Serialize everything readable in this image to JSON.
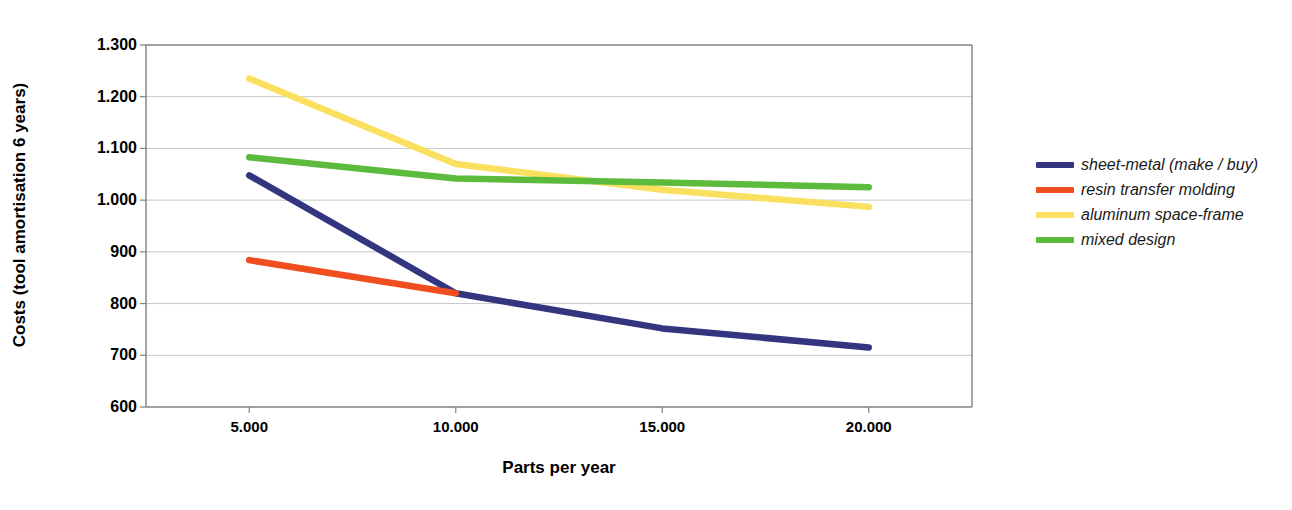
{
  "chart_data": {
    "type": "line",
    "title": "",
    "xlabel": "Parts per year",
    "ylabel": "Costs (tool amortisation 6 years)",
    "x": [
      5000,
      10000,
      15000,
      20000
    ],
    "xtick_labels": [
      "5.000",
      "10.000",
      "15.000",
      "20.000"
    ],
    "ytick_labels": [
      "1.300",
      "1.200",
      "1.100",
      "1.000",
      "900",
      "800",
      "700",
      "600"
    ],
    "ytick_values": [
      1300,
      1200,
      1100,
      1000,
      900,
      800,
      700,
      600
    ],
    "xlim": [
      2500,
      22500
    ],
    "ylim": [
      600,
      1300
    ],
    "grid": true,
    "legend_position": "right",
    "series": [
      {
        "name": "sheet-metal (make / buy)",
        "color": "#33357f",
        "x": [
          5000,
          10000,
          15000,
          20000
        ],
        "values": [
          1048,
          820,
          752,
          715
        ]
      },
      {
        "name": "resin transfer molding",
        "color": "#f04e1e",
        "x": [
          5000,
          10000
        ],
        "values": [
          884,
          820
        ]
      },
      {
        "name": "aluminum space-frame",
        "color": "#fbdf5e",
        "x": [
          5000,
          10000,
          15000,
          20000
        ],
        "values": [
          1235,
          1070,
          1020,
          987
        ]
      },
      {
        "name": "mixed design",
        "color": "#5cbb3c",
        "x": [
          5000,
          10000,
          15000,
          20000
        ],
        "values": [
          1083,
          1042,
          1034,
          1025
        ]
      }
    ]
  },
  "legend": {
    "items": [
      {
        "label": "sheet-metal (make / buy)",
        "color": "#33357f"
      },
      {
        "label": "resin transfer molding",
        "color": "#f04e1e"
      },
      {
        "label": "aluminum space-frame",
        "color": "#fbdf5e"
      },
      {
        "label": "mixed design",
        "color": "#5cbb3c"
      }
    ]
  },
  "colors": {
    "axis": "#808080",
    "grid": "#c8c8c8",
    "text": "#000000"
  }
}
